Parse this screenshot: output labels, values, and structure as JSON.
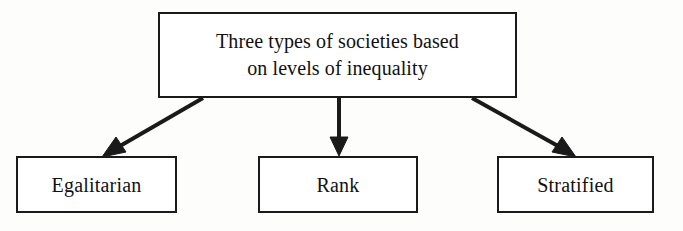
{
  "diagram": {
    "title": "Three types of societies based on levels of inequality",
    "type": "flowchart-tree",
    "orientation": "top-down",
    "background_color": "#fdfdfc",
    "line_color": "#1a1a1a",
    "text_color": "#111111",
    "root": {
      "id": "root",
      "label": "Three types of societies based\non levels of inequality",
      "line1": "Three types of societies based",
      "line2": "on levels of inequality",
      "shape": "rectangle"
    },
    "children": [
      {
        "id": "egalitarian",
        "label": "Egalitarian",
        "shape": "rectangle",
        "arrow": "diagonal-down-left"
      },
      {
        "id": "rank",
        "label": "Rank",
        "shape": "rectangle",
        "arrow": "straight-down"
      },
      {
        "id": "stratified",
        "label": "Stratified",
        "shape": "rectangle",
        "arrow": "diagonal-down-right"
      }
    ],
    "connectors": [
      {
        "id": "connector-left",
        "from": "root",
        "to": "egalitarian",
        "style": "solid",
        "arrowhead": "filled-triangle"
      },
      {
        "id": "connector-middle",
        "from": "root",
        "to": "rank",
        "style": "solid",
        "arrowhead": "filled-triangle"
      },
      {
        "id": "connector-right",
        "from": "root",
        "to": "stratified",
        "style": "solid",
        "arrowhead": "filled-triangle"
      }
    ]
  }
}
